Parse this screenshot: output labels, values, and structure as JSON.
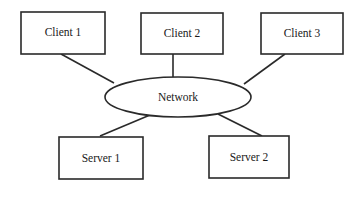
{
  "diagram": {
    "type": "network-topology",
    "hub": {
      "label": "Network"
    },
    "clients": [
      {
        "label": "Client 1"
      },
      {
        "label": "Client 2"
      },
      {
        "label": "Client 3"
      }
    ],
    "servers": [
      {
        "label": "Server 1"
      },
      {
        "label": "Server 2"
      }
    ],
    "colors": {
      "stroke": "#2a2a2a",
      "fill": "#ffffff",
      "text": "#1a1a1a"
    }
  }
}
